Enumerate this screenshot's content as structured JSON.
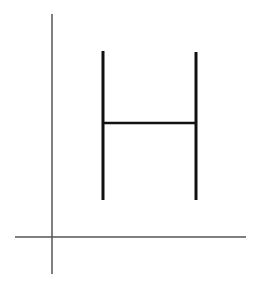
{
  "diagram": {
    "canvas": {
      "width": 261,
      "height": 291,
      "background": "#ffffff"
    },
    "colors": {
      "axis": "#555555",
      "glyph": "#111111"
    },
    "axes": {
      "vertical": {
        "x": 52,
        "y1": 14,
        "y2": 274
      },
      "horizontal": {
        "y": 237,
        "x1": 15,
        "x2": 246
      }
    },
    "letter_h": {
      "left_stem": {
        "x": 103,
        "y1": 51,
        "y2": 200
      },
      "right_stem": {
        "x": 196,
        "y1": 52,
        "y2": 200
      },
      "crossbar": {
        "y": 123,
        "x1": 103,
        "x2": 196
      }
    }
  }
}
